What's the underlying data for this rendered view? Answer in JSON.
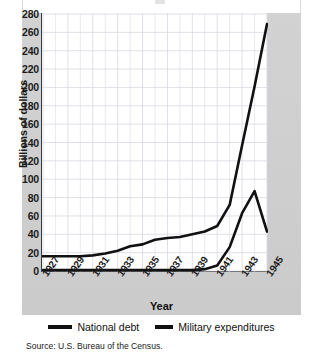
{
  "figure": {
    "source_note": "Source: U.S. Bureau of the Census.",
    "panel_color": "#cfcfcf",
    "plot_bg": "#ffffff",
    "grid_color": "#d8d8e2",
    "line_color": "#111111"
  },
  "legend": {
    "position": "bottom",
    "items": [
      {
        "label": "National debt",
        "marker": "thick-line-swatch",
        "color": "#111111"
      },
      {
        "label": "Military expenditures",
        "marker": "thick-line-swatch",
        "color": "#111111"
      }
    ]
  },
  "axes": {
    "y_title": "Billions of dollars",
    "x_title": "Year",
    "y_ticks": [
      0,
      20,
      40,
      60,
      80,
      100,
      120,
      140,
      160,
      180,
      200,
      220,
      240,
      260,
      280
    ],
    "x_ticks": [
      1927,
      1929,
      1931,
      1933,
      1935,
      1937,
      1939,
      1941,
      1943,
      1945
    ]
  },
  "chart_data": {
    "type": "line",
    "title": "",
    "xlabel": "Year",
    "ylabel": "Billions of dollars",
    "xlim": [
      1927,
      1945
    ],
    "ylim": [
      0,
      280
    ],
    "grid": true,
    "legend_position": "bottom",
    "x": [
      1927,
      1928,
      1929,
      1930,
      1931,
      1932,
      1933,
      1934,
      1935,
      1936,
      1937,
      1938,
      1939,
      1940,
      1941,
      1942,
      1943,
      1944,
      1945
    ],
    "series": [
      {
        "name": "National debt",
        "color": "#111111",
        "values": [
          16,
          16,
          16,
          16,
          17,
          19,
          22,
          27,
          29,
          34,
          36,
          37,
          40,
          43,
          49,
          72,
          137,
          201,
          269
        ]
      },
      {
        "name": "Military expenditures",
        "color": "#111111",
        "values": [
          1,
          1,
          1,
          1,
          1,
          1,
          1,
          1,
          1,
          1,
          1,
          1,
          1,
          2,
          6,
          26,
          63,
          87,
          43
        ]
      }
    ]
  }
}
